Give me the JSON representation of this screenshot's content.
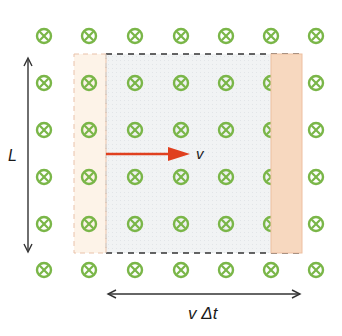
{
  "diagram": {
    "labels": {
      "length": "L",
      "velocity": "v",
      "displacement": "v Δt"
    },
    "symbol": "field-into-page-icon",
    "colors": {
      "field_symbol": "#7ab648",
      "velocity_arrow": "#e0401f",
      "bar_moved": "#f7d7bd",
      "bar_initial": "#fdf2e6",
      "swept_area": "#eef0f1",
      "dimension_arrow": "#333333"
    },
    "field_grid": {
      "columns_x": [
        44,
        89,
        135,
        181,
        226,
        271,
        316
      ],
      "rows_y": [
        36,
        83,
        130,
        177,
        224,
        270
      ]
    }
  }
}
